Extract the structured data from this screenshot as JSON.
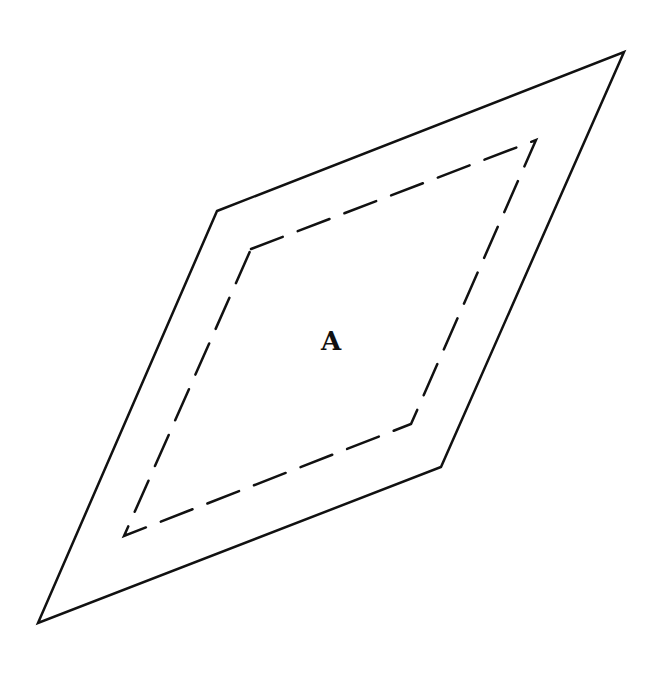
{
  "diagram": {
    "type": "parallelogram-with-inner-dashed-boundary",
    "label": {
      "text": "A",
      "x": 331,
      "y": 341
    },
    "outer_shape": {
      "style": "solid",
      "vertices": [
        [
          217,
          211
        ],
        [
          624,
          52
        ],
        [
          441,
          467
        ],
        [
          38,
          623
        ]
      ],
      "stroke": "#111111",
      "stroke_width": 2.5
    },
    "inner_shape": {
      "style": "dashed",
      "vertices": [
        [
          251,
          249
        ],
        [
          536,
          140
        ],
        [
          411,
          424
        ],
        [
          124,
          536
        ]
      ],
      "stroke": "#111111",
      "stroke_width": 2.5,
      "dash": "34 16"
    }
  }
}
